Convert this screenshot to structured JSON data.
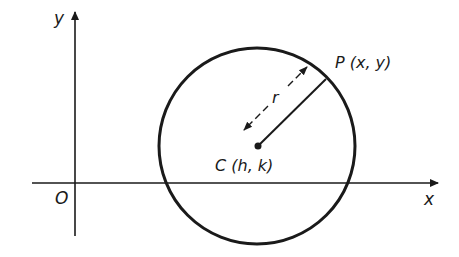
{
  "diagram": {
    "colors": {
      "stroke": "#1a1a1a",
      "background": "#ffffff"
    },
    "axes": {
      "x_label": "x",
      "y_label": "y",
      "origin_label": "O"
    },
    "circle": {
      "center_label": "C (h, k)",
      "point_label": "P (x, y)",
      "radius_label": "r"
    }
  }
}
